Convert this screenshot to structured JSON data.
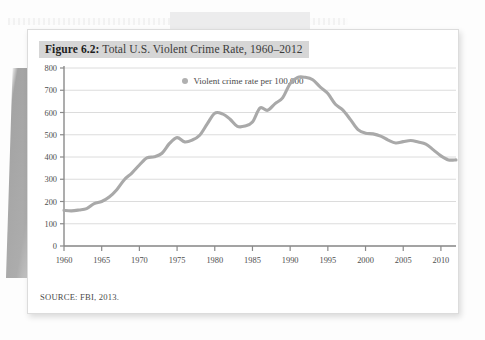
{
  "figure": {
    "number_label": "Figure 6.2:",
    "title_text": " Total U.S. Violent Crime Rate, 1960–2012",
    "source": "SOURCE: FBI, 2013."
  },
  "colors": {
    "line": "#a9a9a9",
    "grid": "#d8d8d8",
    "axis": "#8a8a8a",
    "title_highlight": "#d6d6d6",
    "card": "#ffffff",
    "page": "#fdfdfd"
  },
  "chart_data": {
    "type": "line",
    "title": "Total U.S. Violent Crime Rate, 1960–2012",
    "xlabel": "",
    "ylabel": "",
    "legend": [
      "Violent crime rate per 100,000"
    ],
    "legend_position": "top-center",
    "grid": true,
    "xlim": [
      1960,
      2012
    ],
    "ylim": [
      0,
      800
    ],
    "ytick_labels": [
      "0",
      "100",
      "200",
      "300",
      "400",
      "500",
      "600",
      "700",
      "800"
    ],
    "yticks": [
      0,
      100,
      200,
      300,
      400,
      500,
      600,
      700,
      800
    ],
    "xtick_labels": [
      "1960",
      "1965",
      "1970",
      "1975",
      "1980",
      "1985",
      "1990",
      "1995",
      "2000",
      "2005",
      "2010"
    ],
    "xticks": [
      1960,
      1965,
      1970,
      1975,
      1980,
      1985,
      1990,
      1995,
      2000,
      2005,
      2010
    ],
    "x": [
      1960,
      1961,
      1962,
      1963,
      1964,
      1965,
      1966,
      1967,
      1968,
      1969,
      1970,
      1971,
      1972,
      1973,
      1974,
      1975,
      1976,
      1977,
      1978,
      1979,
      1980,
      1981,
      1982,
      1983,
      1984,
      1985,
      1986,
      1987,
      1988,
      1989,
      1990,
      1991,
      1992,
      1993,
      1994,
      1995,
      1996,
      1997,
      1998,
      1999,
      2000,
      2001,
      2002,
      2003,
      2004,
      2005,
      2006,
      2007,
      2008,
      2009,
      2010,
      2011,
      2012
    ],
    "series": [
      {
        "name": "Violent crime rate per 100,000",
        "values": [
          160,
          158,
          162,
          168,
          190,
          200,
          220,
          253,
          298,
          328,
          364,
          396,
          401,
          417,
          461,
          487,
          468,
          476,
          498,
          549,
          597,
          594,
          571,
          538,
          539,
          557,
          620,
          610,
          640,
          666,
          730,
          758,
          758,
          747,
          714,
          685,
          637,
          611,
          568,
          523,
          507,
          504,
          494,
          476,
          463,
          469,
          474,
          467,
          458,
          432,
          405,
          387,
          387
        ]
      }
    ]
  }
}
